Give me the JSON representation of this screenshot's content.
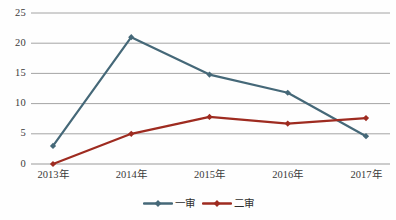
{
  "chart_data": {
    "type": "line",
    "title": "",
    "subtitle": "",
    "xlabel": "",
    "ylabel": "",
    "categories": [
      "2013年",
      "2014年",
      "2015年",
      "2016年",
      "2017年"
    ],
    "series": [
      {
        "name": "一审",
        "color": "#456878",
        "marker": "diamond",
        "values": [
          3.0,
          21.0,
          14.8,
          11.8,
          4.6
        ]
      },
      {
        "name": "二审",
        "color": "#9E2B20",
        "marker": "diamond",
        "values": [
          0,
          5.0,
          7.8,
          6.7,
          7.6
        ]
      }
    ],
    "ylim": [
      0,
      25
    ],
    "ytick_labels": [
      "0",
      "5",
      "10",
      "15",
      "20",
      "25"
    ],
    "ytick_values": [
      0,
      5,
      10,
      15,
      20,
      25
    ],
    "grid": true,
    "grid_color": "#9a9a9a",
    "legend_position": "bottom",
    "background_color": "#fefefe"
  },
  "legend": {
    "entries": [
      {
        "label": "一审"
      },
      {
        "label": "二审"
      }
    ]
  }
}
